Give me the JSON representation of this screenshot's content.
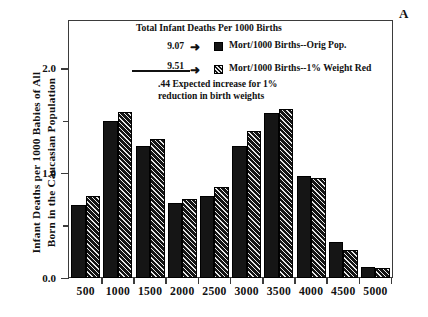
{
  "panel": {
    "letter": "A"
  },
  "axes": {
    "ylabel": "Infant Deaths per 1000 Babies of All\nBorn in the Caucasian Population",
    "ytick_labels": [
      "0.0",
      "1.0",
      "2.0"
    ],
    "xlabel": ""
  },
  "legend": {
    "header": "Total Infant Deaths\nPer 1000 Births",
    "row1_value": "9.07",
    "row1_arrow": "➜",
    "row1_text": "Mort/1000 Births--Orig Pop.",
    "row2_value": "9.51",
    "row2_arrow": "➜",
    "row2_text": "Mort/1000 Births--1% Weight Red",
    "note": ".44 Expected increase for 1%\nreduction in birth weights"
  },
  "chart_data": {
    "type": "bar",
    "title": "",
    "xlabel": "",
    "ylabel": "Infant Deaths per 1000 Babies of All Born in the Caucasian Population",
    "categories": [
      "500",
      "1000",
      "1500",
      "2000",
      "2500",
      "3000",
      "3500",
      "4000",
      "4500",
      "5000"
    ],
    "series": [
      {
        "name": "Mort/1000 Births--Orig Pop.",
        "style": "solid",
        "total": "9.07",
        "values": [
          0.7,
          1.5,
          1.26,
          0.72,
          0.78,
          1.26,
          1.57,
          0.97,
          0.34,
          0.11
        ]
      },
      {
        "name": "Mort/1000 Births--1% Weight Red",
        "style": "hatched",
        "total": "9.51",
        "values": [
          0.78,
          1.58,
          1.33,
          0.75,
          0.87,
          1.4,
          1.61,
          0.95,
          0.27,
          0.1
        ]
      }
    ],
    "ylim": [
      0.0,
      2.45
    ],
    "yticks": [
      0.0,
      0.5,
      1.0,
      1.5,
      2.0
    ],
    "ytick_labels_major": [
      "0.0",
      "1.0",
      "2.0"
    ],
    "grid": false,
    "legend_position": "upper-center",
    "annotation": ".44 Expected increase for 1% reduction in birth weights"
  },
  "colors": {
    "bar_solid": "#151515",
    "bar_hatch_bg": "#1a1a1a",
    "bar_hatch_line": "#e8e8e8",
    "axis": "#3b3b3b",
    "text": "#111111",
    "background": "#ffffff"
  }
}
